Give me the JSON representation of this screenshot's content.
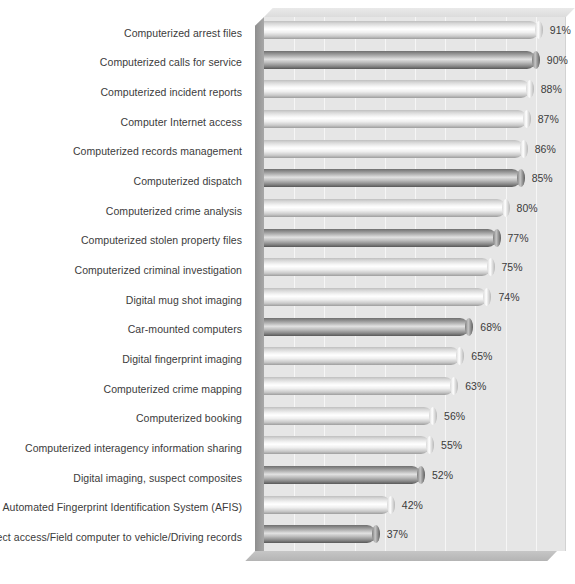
{
  "chart_data": {
    "type": "bar",
    "orientation": "horizontal",
    "title": "",
    "subtitle": "",
    "xlabel": "",
    "ylabel": "",
    "xlim": [
      0,
      100
    ],
    "grid": true,
    "gridline_interval": 10,
    "legend": "none",
    "value_suffix": "%",
    "categories": [
      "Computerized arrest files",
      "Computerized calls for service",
      "Computerized incident reports",
      "Computer Internet access",
      "Computerized records management",
      "Computerized dispatch",
      "Computerized crime analysis",
      "Computerized stolen property files",
      "Computerized criminal investigation",
      "Digital mug shot imaging",
      "Car-mounted computers",
      "Digital fingerprint imaging",
      "Computerized crime mapping",
      "Computerized booking",
      "Computerized interagency information sharing",
      "Digital imaging, suspect composites",
      "Automated Fingerprint Identification System (AFIS)",
      "Direct access/Field computer to vehicle/Driving records"
    ],
    "values": [
      91,
      90,
      88,
      87,
      86,
      85,
      80,
      77,
      75,
      74,
      68,
      65,
      63,
      56,
      55,
      52,
      42,
      37
    ],
    "data_labels": [
      "91%",
      "90%",
      "88%",
      "87%",
      "86%",
      "85%",
      "80%",
      "77%",
      "75%",
      "74%",
      "68%",
      "65%",
      "63%",
      "56%",
      "55%",
      "52%",
      "42%",
      "37%"
    ],
    "bar_styles": [
      "light",
      "dark",
      "light",
      "light",
      "light",
      "dark",
      "light",
      "dark",
      "light",
      "light",
      "dark",
      "light",
      "light",
      "light",
      "light",
      "dark",
      "light",
      "dark"
    ]
  },
  "colors": {
    "plot_background": "#e6e6e6",
    "gridline": "#f6f6f6",
    "text": "#3b3b3b",
    "page_background": "#ffffff",
    "bar_light": "#e8e8e8",
    "bar_dark": "#8a8a8a"
  }
}
